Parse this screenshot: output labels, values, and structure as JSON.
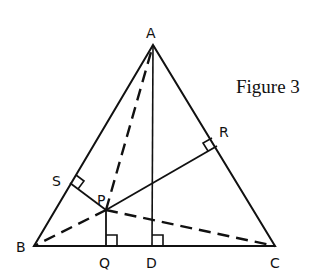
{
  "caption": "Figure 3",
  "points": {
    "A": {
      "label": "A",
      "x": 153,
      "y": 45
    },
    "B": {
      "label": "B",
      "x": 34,
      "y": 246
    },
    "C": {
      "label": "C",
      "x": 275,
      "y": 246
    },
    "P": {
      "label": "P",
      "x": 106,
      "y": 210
    },
    "Q": {
      "label": "Q",
      "x": 106,
      "y": 246
    },
    "D": {
      "label": "D",
      "x": 152,
      "y": 246
    },
    "R": {
      "label": "R",
      "x": 217,
      "y": 146
    },
    "S": {
      "label": "S",
      "x": 70,
      "y": 183
    }
  },
  "colors": {
    "ink": "#111111",
    "background": "#ffffff"
  }
}
